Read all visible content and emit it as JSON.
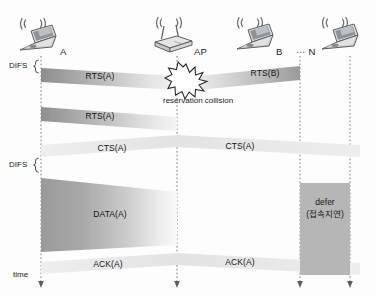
{
  "diagram": {
    "axis_label": "time",
    "nodes": [
      {
        "id": "A",
        "label": "A",
        "icon": "laptop-icon",
        "x": 41
      },
      {
        "id": "AP",
        "label": "AP",
        "icon": "access-point-icon",
        "x": 177
      },
      {
        "id": "B",
        "label": "B",
        "icon": "laptop-icon",
        "x": 300
      },
      {
        "id": "N",
        "label": "⋯ N",
        "icon": "laptop-icon",
        "x": 350
      }
    ],
    "interframe_spaces": [
      {
        "label": "DIFS",
        "y": 66
      },
      {
        "label": "DIFS",
        "y": 166
      }
    ],
    "messages": [
      {
        "name": "rts-a-1",
        "label": "RTS(A)",
        "from": "A",
        "to": "AP",
        "y": 79
      },
      {
        "name": "rts-b",
        "label": "RTS(B)",
        "from": "B",
        "to": "AP",
        "y": 79
      },
      {
        "name": "rts-a-2",
        "label": "RTS(A)",
        "from": "A",
        "to": "AP",
        "y": 118
      },
      {
        "name": "cts-a-left",
        "label": "CTS(A)",
        "from": "AP",
        "to": "A",
        "y": 148
      },
      {
        "name": "cts-a-right",
        "label": "CTS(A)",
        "from": "AP",
        "to": "N",
        "y": 148
      },
      {
        "name": "data-a",
        "label": "DATA(A)",
        "from": "A",
        "to": "AP",
        "y": 215
      },
      {
        "name": "ack-a-left",
        "label": "ACK(A)",
        "from": "AP",
        "to": "A",
        "y": 265
      },
      {
        "name": "ack-a-right",
        "label": "ACK(A)",
        "from": "AP",
        "to": "N",
        "y": 265
      }
    ],
    "collision": {
      "label": "reservation collision",
      "icon": "starburst-icon",
      "x": 186,
      "y": 82
    },
    "defer": {
      "label_en": "defer",
      "label_ko": "(접속지연)",
      "x": 300,
      "y": 183,
      "width": 50,
      "height": 92
    },
    "colors": {
      "band_dark": "#8a8a8a",
      "band_light": "#e6e6e6",
      "band_pale": "#efefef",
      "defer_fill": "#b6b6b6",
      "timeline": "#6f6f6f",
      "text": "#1a1a1a",
      "background": "#fdfdfd"
    }
  }
}
